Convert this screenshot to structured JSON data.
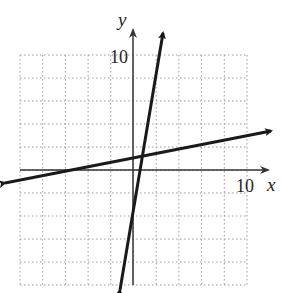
{
  "graph": {
    "x_axis_label": "x",
    "y_axis_label": "y",
    "x_tick_label": "10",
    "y_tick_label": "10",
    "range": {
      "xmin": -10,
      "xmax": 10,
      "ymin": -10,
      "ymax": 10
    },
    "grid_step": 2,
    "lines": [
      {
        "name": "steep-line",
        "equation": "y = 6x - 4",
        "slope": 6,
        "intercept": -4
      },
      {
        "name": "shallow-line",
        "equation": "y = 0.2x + 1",
        "slope": 0.2,
        "intercept": 1
      }
    ],
    "intersection": {
      "x": 0.86,
      "y": 1.17
    }
  },
  "colors": {
    "grid": "#9a9a9a",
    "axis": "#333333",
    "line": "#1a1a1a"
  }
}
